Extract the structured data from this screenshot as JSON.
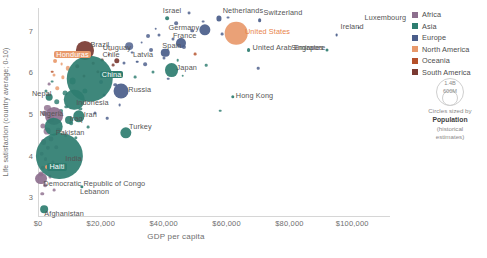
{
  "chart_data": {
    "type": "scatter",
    "title": "",
    "xlabel": "GDP per capita",
    "ylabel": "Life satisfaction (country average; 0-10)",
    "xlim": [
      0,
      112000
    ],
    "ylim": [
      2.55,
      7.55
    ],
    "xticks": [
      "$0",
      "$20,000",
      "$40,000",
      "$60,000",
      "$80,000",
      "$100,000"
    ],
    "xtick_values": [
      0,
      20000,
      40000,
      60000,
      80000,
      100000
    ],
    "yticks": [
      "3",
      "4",
      "5",
      "6",
      "7"
    ],
    "ytick_values": [
      3,
      4,
      5,
      6,
      7
    ],
    "grid": false,
    "legend_position": "right",
    "size_encoding": "Population (historical estimates)",
    "points": [
      {
        "label": "Luxembourg",
        "x": 102000,
        "y": 7.08,
        "pop": 0.6,
        "region": "Europe",
        "lx": 6,
        "ly": -11
      },
      {
        "label": "Ireland",
        "x": 95000,
        "y": 6.9,
        "pop": 5,
        "region": "Europe",
        "lx": 4,
        "ly": -9
      },
      {
        "label": "Singapore",
        "x": 92000,
        "y": 6.55,
        "pop": 6,
        "region": "Asia",
        "lx": -36,
        "ly": -3
      },
      {
        "label": "Switzerland",
        "x": 70500,
        "y": 7.25,
        "pop": 9,
        "region": "Europe",
        "lx": 4,
        "ly": -8
      },
      {
        "label": "Netherlands",
        "x": 57500,
        "y": 7.3,
        "pop": 17,
        "region": "Europe",
        "lx": 4,
        "ly": -8
      },
      {
        "label": "United States",
        "x": 63000,
        "y": 6.95,
        "pop": 332,
        "region": "North America",
        "lx": 9,
        "ly": -2,
        "highlight": "plain"
      },
      {
        "label": "United Arab Emirates",
        "x": 67000,
        "y": 6.55,
        "pop": 10,
        "region": "Asia",
        "lx": 4,
        "ly": -3
      },
      {
        "label": "Germany",
        "x": 53000,
        "y": 7.02,
        "pop": 83,
        "region": "Europe",
        "lx": -36,
        "ly": -3
      },
      {
        "label": "Israel",
        "x": 41000,
        "y": 7.3,
        "pop": 9,
        "region": "Asia",
        "lx": -4,
        "ly": -8
      },
      {
        "label": "France",
        "x": 45500,
        "y": 6.7,
        "pop": 65,
        "region": "Europe",
        "lx": -8,
        "ly": -8
      },
      {
        "label": "Spain",
        "x": 40500,
        "y": 6.48,
        "pop": 47,
        "region": "Europe",
        "lx": -3,
        "ly": -8
      },
      {
        "label": "Japan",
        "x": 42500,
        "y": 6.06,
        "pop": 126,
        "region": "Asia",
        "lx": 5,
        "ly": -3
      },
      {
        "label": "Latvia",
        "x": 31500,
        "y": 6.26,
        "pop": 2,
        "region": "Europe",
        "lx": -4,
        "ly": -8
      },
      {
        "label": "Uruguay",
        "x": 22500,
        "y": 6.43,
        "pop": 3.5,
        "region": "South America",
        "lx": -6,
        "ly": -8
      },
      {
        "label": "Chile",
        "x": 25000,
        "y": 6.28,
        "pop": 19,
        "region": "South America",
        "lx": -14,
        "ly": -7
      },
      {
        "label": "Brazil",
        "x": 14800,
        "y": 6.53,
        "pop": 213,
        "region": "South America",
        "lx": 6,
        "ly": -6
      },
      {
        "label": "Honduras",
        "x": 5500,
        "y": 6.28,
        "pop": 10,
        "region": "North America",
        "lx": -1,
        "ly": -7,
        "highlight": "salmon"
      },
      {
        "label": "China",
        "x": 16500,
        "y": 5.85,
        "pop": 1410,
        "region": "Asia",
        "lx": 10,
        "ly": -5,
        "highlight": "teal"
      },
      {
        "label": "Russia",
        "x": 26500,
        "y": 5.55,
        "pop": 145,
        "region": "Europe",
        "lx": 7,
        "ly": -2
      },
      {
        "label": "Indonesia",
        "x": 11500,
        "y": 5.35,
        "pop": 274,
        "region": "Asia",
        "lx": 2,
        "ly": 2
      },
      {
        "label": "Nepal",
        "x": 3500,
        "y": 5.4,
        "pop": 29,
        "region": "Asia",
        "lx": -17,
        "ly": -4
      },
      {
        "label": "Nigeria",
        "x": 5000,
        "y": 4.95,
        "pop": 211,
        "region": "Africa",
        "lx": -14,
        "ly": -3
      },
      {
        "label": "Iraq",
        "x": 9800,
        "y": 4.85,
        "pop": 41,
        "region": "Asia",
        "lx": 1,
        "ly": -2
      },
      {
        "label": "Iran",
        "x": 13000,
        "y": 4.95,
        "pop": 85,
        "region": "Asia",
        "lx": 5,
        "ly": -2
      },
      {
        "label": "Pakistan",
        "x": 5000,
        "y": 4.7,
        "pop": 225,
        "region": "Asia",
        "lx": 2,
        "ly": 5
      },
      {
        "label": "India",
        "x": 6800,
        "y": 4.0,
        "pop": 1390,
        "region": "Asia",
        "lx": 6,
        "ly": 2
      },
      {
        "label": "Haiti",
        "x": 3000,
        "y": 3.72,
        "pop": 11,
        "region": "North America",
        "lx": 0,
        "ly": -1,
        "highlight": "teal"
      },
      {
        "label": "Turkey",
        "x": 28000,
        "y": 4.55,
        "pop": 84,
        "region": "Asia",
        "lx": 3,
        "ly": -7
      },
      {
        "label": "Hong Kong",
        "x": 62000,
        "y": 5.42,
        "pop": 7.5,
        "region": "Asia",
        "lx": 3,
        "ly": -2
      },
      {
        "label": "Democratic Republic of Congo",
        "x": 1100,
        "y": 3.45,
        "pop": 92,
        "region": "Africa",
        "lx": 2,
        "ly": 4
      },
      {
        "label": "Lebanon",
        "x": 14000,
        "y": 3.25,
        "pop": 7,
        "region": "Asia",
        "lx": -2,
        "ly": 4
      },
      {
        "label": "Afghanistan",
        "x": 2000,
        "y": 2.72,
        "pop": 39,
        "region": "Asia",
        "lx": 0,
        "ly": 4
      }
    ],
    "unlabeled_points": [
      {
        "x": 48000,
        "y": 7.43,
        "pop": 5.5,
        "region": "Europe"
      },
      {
        "x": 60500,
        "y": 7.32,
        "pop": 5.5,
        "region": "Europe"
      },
      {
        "x": 52500,
        "y": 7.22,
        "pop": 5,
        "region": "Europe"
      },
      {
        "x": 44000,
        "y": 7.18,
        "pop": 9,
        "region": "Europe"
      },
      {
        "x": 37500,
        "y": 7.05,
        "pop": 4,
        "region": "Europe"
      },
      {
        "x": 49000,
        "y": 7.0,
        "pop": 8,
        "region": "Europe"
      },
      {
        "x": 58500,
        "y": 6.92,
        "pop": 5,
        "region": "Europe"
      },
      {
        "x": 38500,
        "y": 6.9,
        "pop": 6,
        "region": "Europe"
      },
      {
        "x": 35000,
        "y": 6.88,
        "pop": 10,
        "region": "Europe"
      },
      {
        "x": 43000,
        "y": 6.8,
        "pop": 6,
        "region": "Europe"
      },
      {
        "x": 46500,
        "y": 6.62,
        "pop": 11,
        "region": "Europe"
      },
      {
        "x": 33000,
        "y": 6.72,
        "pop": 5,
        "region": "Europe"
      },
      {
        "x": 29000,
        "y": 6.63,
        "pop": 38,
        "region": "Europe"
      },
      {
        "x": 36000,
        "y": 6.55,
        "pop": 10,
        "region": "Europe"
      },
      {
        "x": 30000,
        "y": 6.48,
        "pop": 5,
        "region": "Europe"
      },
      {
        "x": 40000,
        "y": 6.34,
        "pop": 6,
        "region": "Europe"
      },
      {
        "x": 44500,
        "y": 6.3,
        "pop": 4,
        "region": "Asia"
      },
      {
        "x": 34000,
        "y": 6.2,
        "pop": 9,
        "region": "Europe"
      },
      {
        "x": 27500,
        "y": 6.22,
        "pop": 6,
        "region": "Europe"
      },
      {
        "x": 24000,
        "y": 6.18,
        "pop": 5,
        "region": "South America"
      },
      {
        "x": 20500,
        "y": 6.3,
        "pop": 5,
        "region": "South America"
      },
      {
        "x": 17500,
        "y": 6.22,
        "pop": 4,
        "region": "South America"
      },
      {
        "x": 12500,
        "y": 6.15,
        "pop": 8,
        "region": "South America"
      },
      {
        "x": 9500,
        "y": 6.1,
        "pop": 12,
        "region": "North America"
      },
      {
        "x": 7500,
        "y": 6.2,
        "pop": 5,
        "region": "North America"
      },
      {
        "x": 5000,
        "y": 5.95,
        "pop": 6,
        "region": "North America"
      },
      {
        "x": 3500,
        "y": 5.72,
        "pop": 5,
        "region": "Africa"
      },
      {
        "x": 11000,
        "y": 5.8,
        "pop": 30,
        "region": "Asia"
      },
      {
        "x": 20000,
        "y": 5.78,
        "pop": 10,
        "region": "Europe"
      },
      {
        "x": 24500,
        "y": 5.7,
        "pop": 8,
        "region": "Europe"
      },
      {
        "x": 31000,
        "y": 5.88,
        "pop": 5,
        "region": "Asia"
      },
      {
        "x": 36500,
        "y": 6.02,
        "pop": 6,
        "region": "Asia"
      },
      {
        "x": 41500,
        "y": 5.85,
        "pop": 4,
        "region": "Europe"
      },
      {
        "x": 46000,
        "y": 5.92,
        "pop": 3,
        "region": "Asia"
      },
      {
        "x": 15000,
        "y": 5.55,
        "pop": 18,
        "region": "Asia"
      },
      {
        "x": 8500,
        "y": 5.5,
        "pop": 15,
        "region": "Asia"
      },
      {
        "x": 6000,
        "y": 5.3,
        "pop": 20,
        "region": "Asia"
      },
      {
        "x": 3000,
        "y": 5.15,
        "pop": 25,
        "region": "Africa"
      },
      {
        "x": 2000,
        "y": 5.02,
        "pop": 14,
        "region": "Africa"
      },
      {
        "x": 4200,
        "y": 4.88,
        "pop": 22,
        "region": "Africa"
      },
      {
        "x": 1500,
        "y": 4.72,
        "pop": 18,
        "region": "Africa"
      },
      {
        "x": 2800,
        "y": 4.6,
        "pop": 30,
        "region": "Africa"
      },
      {
        "x": 6500,
        "y": 4.62,
        "pop": 12,
        "region": "Africa"
      },
      {
        "x": 8800,
        "y": 4.48,
        "pop": 9,
        "region": "Africa"
      },
      {
        "x": 4000,
        "y": 4.4,
        "pop": 16,
        "region": "Africa"
      },
      {
        "x": 1800,
        "y": 4.32,
        "pop": 22,
        "region": "Africa"
      },
      {
        "x": 3200,
        "y": 4.18,
        "pop": 12,
        "region": "Africa"
      },
      {
        "x": 5800,
        "y": 4.2,
        "pop": 8,
        "region": "Africa"
      },
      {
        "x": 1200,
        "y": 4.05,
        "pop": 14,
        "region": "Africa"
      },
      {
        "x": 2400,
        "y": 3.92,
        "pop": 10,
        "region": "Africa"
      },
      {
        "x": 4800,
        "y": 3.85,
        "pop": 7,
        "region": "Africa"
      },
      {
        "x": 1600,
        "y": 3.7,
        "pop": 12,
        "region": "Africa"
      },
      {
        "x": 900,
        "y": 3.55,
        "pop": 16,
        "region": "Africa"
      },
      {
        "x": 3800,
        "y": 3.5,
        "pop": 6,
        "region": "Africa"
      },
      {
        "x": 2200,
        "y": 3.3,
        "pop": 9,
        "region": "Africa"
      },
      {
        "x": 5200,
        "y": 3.18,
        "pop": 5,
        "region": "Africa"
      },
      {
        "x": 1400,
        "y": 3.08,
        "pop": 8,
        "region": "Africa"
      },
      {
        "x": 7200,
        "y": 5.08,
        "pop": 10,
        "region": "Asia"
      },
      {
        "x": 9000,
        "y": 5.18,
        "pop": 8,
        "region": "Asia"
      },
      {
        "x": 13500,
        "y": 5.12,
        "pop": 7,
        "region": "Asia"
      },
      {
        "x": 18000,
        "y": 5.02,
        "pop": 6,
        "region": "Europe"
      },
      {
        "x": 21000,
        "y": 5.45,
        "pop": 6,
        "region": "Europe"
      },
      {
        "x": 26000,
        "y": 5.22,
        "pop": 5,
        "region": "Europe"
      },
      {
        "x": 10500,
        "y": 4.78,
        "pop": 9,
        "region": "Asia"
      },
      {
        "x": 16000,
        "y": 4.68,
        "pop": 5,
        "region": "Asia"
      },
      {
        "x": 12000,
        "y": 4.42,
        "pop": 7,
        "region": "Asia"
      },
      {
        "x": 22000,
        "y": 4.9,
        "pop": 4,
        "region": "Europe"
      },
      {
        "x": 53500,
        "y": 6.18,
        "pop": 4,
        "region": "Asia"
      },
      {
        "x": 58000,
        "y": 5.08,
        "pop": 3,
        "region": "Asia"
      },
      {
        "x": 70000,
        "y": 6.1,
        "pop": 3,
        "region": "Europe"
      },
      {
        "x": 6200,
        "y": 5.62,
        "pop": 8,
        "region": "North America"
      },
      {
        "x": 8000,
        "y": 5.88,
        "pop": 7,
        "region": "North America"
      },
      {
        "x": 14500,
        "y": 5.92,
        "pop": 6,
        "region": "South America"
      },
      {
        "x": 19000,
        "y": 6.02,
        "pop": 7,
        "region": "South America"
      },
      {
        "x": 10000,
        "y": 6.38,
        "pop": 5,
        "region": "North America"
      },
      {
        "x": 12800,
        "y": 6.45,
        "pop": 4,
        "region": "North America"
      },
      {
        "x": 4600,
        "y": 6.02,
        "pop": 4,
        "region": "Oceania"
      },
      {
        "x": 23000,
        "y": 6.55,
        "pop": 3,
        "region": "North America"
      },
      {
        "x": 50000,
        "y": 6.45,
        "pop": 5,
        "region": "Oceania"
      },
      {
        "x": 2600,
        "y": 5.55,
        "pop": 6,
        "region": "Asia"
      },
      {
        "x": 4400,
        "y": 5.78,
        "pop": 5,
        "region": "Asia"
      }
    ]
  },
  "legend": {
    "items": [
      {
        "label": "Africa",
        "color": "#8d6f8e"
      },
      {
        "label": "Asia",
        "color": "#2e7d70"
      },
      {
        "label": "Europe",
        "color": "#4a5d8a"
      },
      {
        "label": "North America",
        "color": "#e8996b"
      },
      {
        "label": "Oceania",
        "color": "#b5502a"
      },
      {
        "label": "South America",
        "color": "#7a3a32"
      }
    ]
  },
  "size_legend": {
    "big_label": "1.4B",
    "small_label": "600M",
    "caption_line1": "Circles sized by",
    "caption_bold": "Population",
    "caption_line2": "(historical",
    "caption_line3": "estimates)"
  },
  "colors": {
    "africa": "#8d6f8e",
    "asia": "#2e7d70",
    "europe": "#4a5d8a",
    "north_america": "#e8996b",
    "oceania": "#b5502a",
    "south_america": "#7a3a32",
    "axis": "#d6d6d6",
    "text": "#5b5b5b",
    "highlight_teal": "#2e7d70",
    "highlight_salmon": "#e8996b",
    "highlight_us": "#e8834a"
  }
}
